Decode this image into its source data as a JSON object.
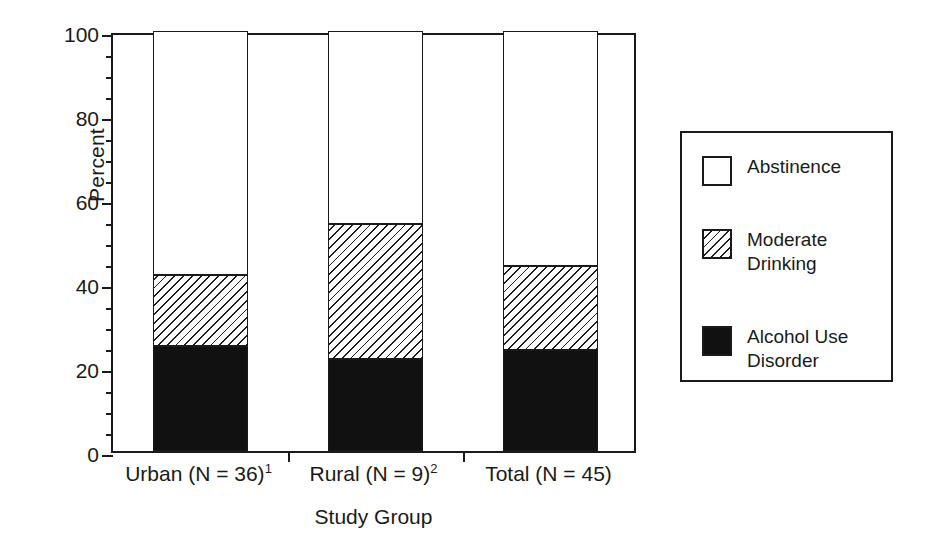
{
  "chart_data": {
    "type": "bar",
    "subtype": "stacked-bar-100",
    "title": "",
    "xlabel": "Study Group",
    "ylabel": "Percent",
    "ylim": [
      0,
      100
    ],
    "ytick_labels": [
      "0",
      "20",
      "40",
      "60",
      "80",
      "100"
    ],
    "ytick_values": [
      0,
      20,
      40,
      60,
      80,
      100
    ],
    "yminor_step": 5,
    "grid": false,
    "legend_position": "right-outside",
    "categories": [
      "Urban (N = 36)",
      "Rural (N = 9)",
      "Total (N = 45)"
    ],
    "category_labels": [
      {
        "text": "Urban (N = 36)",
        "superscript": "1"
      },
      {
        "text": "Rural (N = 9)",
        "superscript": "2"
      },
      {
        "text": "Total (N = 45)",
        "superscript": ""
      }
    ],
    "series": [
      {
        "name": "Alcohol Use Disorder",
        "fill": "solid-black",
        "values": [
          25,
          22,
          24
        ]
      },
      {
        "name": "Moderate Drinking",
        "fill": "diagonal-hatch",
        "values": [
          17,
          32,
          20
        ]
      },
      {
        "name": "Abstinence",
        "fill": "white",
        "values": [
          58,
          46,
          56
        ]
      }
    ],
    "cumulative_tops": {
      "Alcohol Use Disorder": [
        25,
        22,
        24
      ],
      "Moderate Drinking": [
        42,
        54,
        44
      ],
      "Abstinence": [
        100,
        100,
        100
      ]
    },
    "colors": {
      "axis": "#1a1a1a",
      "solid_black": "#111111",
      "hatch_line": "#1a1a1a",
      "background": "#ffffff"
    }
  },
  "axes": {
    "y_title": "Percent",
    "x_title": "Study Group"
  },
  "legend": {
    "items": [
      {
        "label": "Abstinence",
        "swatch": "white-square"
      },
      {
        "label": "Moderate\nDrinking",
        "swatch": "hatched-square"
      },
      {
        "label": "Alcohol Use\nDisorder",
        "swatch": "black-square"
      }
    ]
  }
}
